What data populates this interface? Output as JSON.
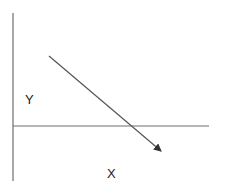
{
  "diagram": {
    "labels": {
      "y_axis": "Y",
      "x_axis": "X"
    },
    "colors": {
      "axis": "#6e6e6e",
      "arrow": "#555555",
      "text": "#222222",
      "background": "#ffffff"
    },
    "elements": [
      {
        "type": "axis",
        "name": "vertical-axis"
      },
      {
        "type": "axis",
        "name": "horizontal-axis"
      },
      {
        "type": "arrow",
        "name": "descending-arrow",
        "direction": "down-right"
      }
    ]
  }
}
